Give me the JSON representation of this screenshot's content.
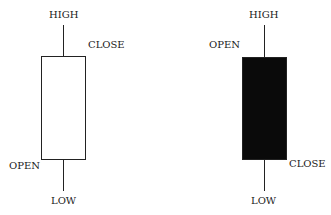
{
  "diagram": {
    "type": "candlestick-anatomy",
    "candles": [
      {
        "name": "bullish",
        "fill": "#ffffff",
        "labels": {
          "top": "HIGH",
          "body_top": "CLOSE",
          "body_bottom": "OPEN",
          "bottom": "LOW"
        }
      },
      {
        "name": "bearish",
        "fill": "#0a0a0a",
        "labels": {
          "top": "HIGH",
          "body_top": "OPEN",
          "body_bottom": "CLOSE",
          "bottom": "LOW"
        }
      }
    ]
  }
}
